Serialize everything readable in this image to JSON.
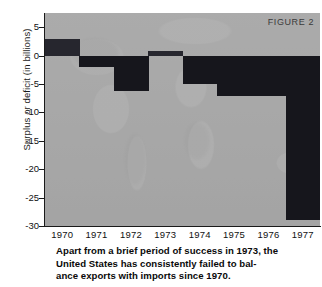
{
  "figure": {
    "label": "FIGURE 2"
  },
  "axes": {
    "ylabel": "Surplus or deficit (in billions)",
    "yticks": [
      "5",
      "0",
      "-5",
      "-10",
      "-15",
      "-20",
      "-25",
      "-30"
    ],
    "xticks": [
      "1970",
      "1971",
      "1972",
      "1973",
      "1974",
      "1975",
      "1976",
      "1977"
    ]
  },
  "caption": {
    "line1": "Apart from a brief period of success in 1973, the",
    "line2": "United States has consistently failed to bal-",
    "line3": "ance  exports with imports since 1970."
  },
  "colors": {
    "plot_background": "#a9a9a9",
    "bar": "#16161c",
    "axis": "#1a1a1a",
    "text": "#111111"
  },
  "chart_data": {
    "type": "bar",
    "title": "FIGURE 2",
    "xlabel": "",
    "ylabel": "Surplus or deficit (in billions)",
    "categories": [
      "1970",
      "1971",
      "1972",
      "1973",
      "1974",
      "1975",
      "1976",
      "1977"
    ],
    "values": [
      3.0,
      -2.0,
      -6.2,
      0.8,
      -5.0,
      -7.2,
      -7.2,
      -29.0
    ],
    "ylim": [
      -30,
      7.5
    ],
    "ytick_values": [
      5,
      0,
      -5,
      -10,
      -15,
      -20,
      -25,
      -30
    ],
    "grid": false,
    "legend": null
  }
}
